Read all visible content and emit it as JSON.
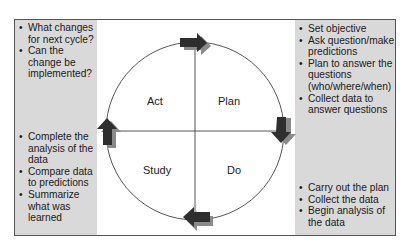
{
  "diagram": {
    "type": "PDSA cycle",
    "quadrants": [
      {
        "id": "act",
        "label": "Act"
      },
      {
        "id": "plan",
        "label": "Plan"
      },
      {
        "id": "study",
        "label": "Study"
      },
      {
        "id": "do",
        "label": "Do"
      }
    ],
    "notes": {
      "act": [
        "What changes for next cycle?",
        "Can the change be implemented?"
      ],
      "study": [
        "Complete the analysis of the data",
        "Compare data to predictions",
        "Summarize what was learned"
      ],
      "plan": [
        "Set objective",
        "Ask question/make predictions",
        "Plan to answer the questions (who/where/when)",
        "Collect data to answer questions"
      ],
      "do": [
        "Carry out the plan",
        "Collect the data",
        "Begin analysis of the data"
      ]
    },
    "arrows": [
      {
        "position": "top",
        "direction": "right"
      },
      {
        "position": "right",
        "direction": "down"
      },
      {
        "position": "bottom",
        "direction": "left"
      },
      {
        "position": "left",
        "direction": "up"
      }
    ],
    "colors": {
      "panel": "#d9d9d9",
      "arrow": "#333333",
      "arrow_shadow": "#8a8a8a",
      "line": "#444444"
    }
  }
}
